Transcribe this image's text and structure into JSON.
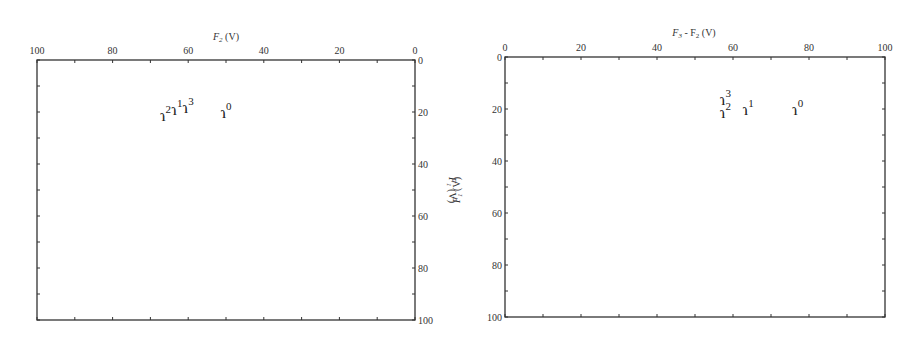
{
  "chart_data": [
    {
      "type": "scatter",
      "title": "",
      "xlabel": "F2 (V)",
      "ylabel": "F1 (V)",
      "xlim": [
        100,
        0
      ],
      "ylim": [
        100,
        0
      ],
      "x_ticks": [
        "100",
        "80",
        "60",
        "40",
        "20",
        "0"
      ],
      "y_ticks": [
        "0",
        "20",
        "40",
        "60",
        "80",
        "100"
      ],
      "grid": false,
      "legend": null,
      "points": [
        {
          "label": "ɿ0",
          "base": "ɿ",
          "sup": "0",
          "x": 50,
          "y": 20
        },
        {
          "label": "ɿ1",
          "base": "ɿ",
          "sup": "1",
          "x": 63,
          "y": 19
        },
        {
          "label": "ɿ2",
          "base": "ɿ",
          "sup": "2",
          "x": 66,
          "y": 21
        },
        {
          "label": "ɿ3",
          "base": "ɿ",
          "sup": "3",
          "x": 60,
          "y": 18
        }
      ]
    },
    {
      "type": "scatter",
      "title": "",
      "xlabel": "F3 - F2 (V)",
      "ylabel": "F1 (V)",
      "xlim": [
        0,
        100
      ],
      "ylim": [
        100,
        0
      ],
      "x_ticks": [
        "0",
        "20",
        "40",
        "60",
        "80",
        "100"
      ],
      "y_ticks": [
        "0",
        "20",
        "40",
        "60",
        "80",
        "100"
      ],
      "grid": false,
      "legend": null,
      "points": [
        {
          "label": "ɿ0",
          "base": "ɿ",
          "sup": "0",
          "x": 77,
          "y": 20
        },
        {
          "label": "ɿ1",
          "base": "ɿ",
          "sup": "1",
          "x": 64,
          "y": 20
        },
        {
          "label": "ɿ2",
          "base": "ɿ",
          "sup": "2",
          "x": 58,
          "y": 21
        },
        {
          "label": "ɿ3",
          "base": "ɿ",
          "sup": "3",
          "x": 58,
          "y": 16
        }
      ]
    }
  ],
  "left_chart": {
    "xlabel_main": "F",
    "xlabel_sub": "2",
    "xlabel_unit": " (V)",
    "ylabel_main": "F",
    "ylabel_sub": "1",
    "ylabel_unit": " (V)"
  },
  "right_chart": {
    "xlabel_main": "F",
    "xlabel_sub": "3",
    "xlabel_rest": " - F",
    "xlabel_sub2": "2",
    "xlabel_unit": " (V)",
    "ylabel_main": "F",
    "ylabel_sub": "1",
    "ylabel_unit": " (V)"
  }
}
